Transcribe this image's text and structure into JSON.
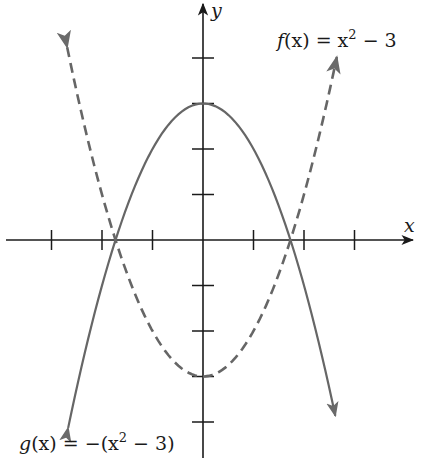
{
  "chart_data": {
    "type": "line",
    "title": "",
    "xlabel": "x",
    "ylabel": "y",
    "xlim": [
      -4,
      4
    ],
    "ylim": [
      -4.6,
      5.2
    ],
    "x_ticks": [
      -3,
      -2,
      -1,
      1,
      2,
      3
    ],
    "y_ticks": [
      -4,
      -3,
      -2,
      -1,
      1,
      2,
      3,
      4
    ],
    "tick_labels_shown": false,
    "grid": false,
    "legend": "inline annotations",
    "series": [
      {
        "name": "f(x) = x^2 - 3",
        "style": "dashed",
        "color": "#666666",
        "x_range": [
          -2.69,
          2.65
        ],
        "vertex": [
          0,
          -3
        ],
        "roots": [
          -1.732,
          1.732
        ],
        "arrows": "both ends"
      },
      {
        "name": "g(x) = -(x^2 - 3)",
        "style": "solid",
        "color": "#666666",
        "x_range": [
          -2.67,
          2.62
        ],
        "vertex": [
          0,
          3
        ],
        "roots": [
          -1.732,
          1.732
        ],
        "arrows": "both ends"
      }
    ],
    "annotations": [
      {
        "text": "f(x) = x² − 3",
        "near": "upper-right arrow of f"
      },
      {
        "text": "g(x) = −(x² − 3)",
        "near": "lower-left arrow of g"
      }
    ]
  },
  "labels": {
    "x_axis": "x",
    "y_axis": "y",
    "f": {
      "name": "f",
      "arg": "(x) = x",
      "exp": "2",
      "rest": " − 3"
    },
    "g": {
      "name": "g",
      "arg": "(x) = −(x",
      "exp": "2",
      "rest": " − 3)"
    }
  },
  "colors": {
    "axis": "#1a1a1a",
    "curve": "#6a6a6a"
  }
}
